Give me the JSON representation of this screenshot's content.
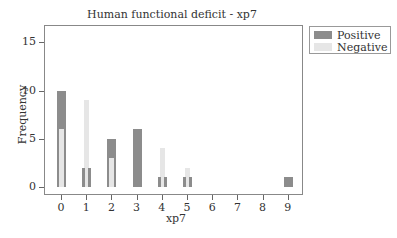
{
  "chart_data": {
    "type": "bar",
    "title": "Human functional deficit - xp7",
    "xlabel": "xp7",
    "ylabel": "Frequency",
    "categories": [
      "0",
      "1",
      "2",
      "3",
      "4",
      "5",
      "6",
      "7",
      "8",
      "9"
    ],
    "series": [
      {
        "name": "Positive",
        "color": "#8c8c8c",
        "values": [
          10,
          2,
          5,
          6,
          1,
          1,
          0,
          0,
          0,
          1
        ]
      },
      {
        "name": "Negative",
        "color": "#e6e6e6",
        "values": [
          6,
          9,
          3,
          0,
          4,
          2,
          0,
          0,
          0,
          0
        ]
      }
    ],
    "yticks": [
      "0",
      "5",
      "10",
      "15"
    ],
    "ylim": [
      -1,
      17
    ],
    "grid": false,
    "legend_position": "right-top"
  }
}
